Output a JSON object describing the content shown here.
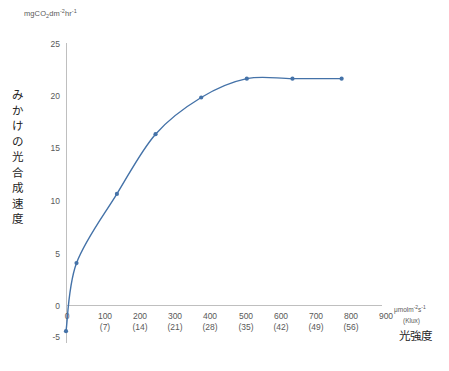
{
  "axes": {
    "y_unit_label": "mgCO2dm-2hr-1",
    "y_unit_parts": {
      "prefix": "mgCO",
      "sub": "2",
      "mid": "dm",
      "sup1": "-2",
      "mid2": "hr",
      "sup2": "-1"
    },
    "y_title_chars": [
      "み",
      "か",
      "け",
      "の",
      "光",
      "合",
      "成",
      "速",
      "度"
    ],
    "y_title": "みかけの光合成速度",
    "y_ticks": [
      "25",
      "20",
      "15",
      "10",
      "5",
      "0",
      "-5"
    ],
    "x_unit_label": "μmolm-2s-1",
    "x_unit_parts": {
      "prefix": "μmolm",
      "sup1": "-2",
      "mid": "s",
      "sup2": "-1"
    },
    "x_unit_secondary": "(Klux)",
    "x_title": "光強度",
    "x_ticks_primary": [
      "0",
      "100",
      "200",
      "300",
      "400",
      "500",
      "600",
      "700",
      "800",
      "900"
    ],
    "x_ticks_secondary": [
      "",
      "(7)",
      "(14)",
      "(21)",
      "(28)",
      "(35)",
      "(42)",
      "(49)",
      "(56)",
      ""
    ]
  },
  "chart_data": {
    "type": "scatter",
    "title": "",
    "xlabel": "光強度 μmolm⁻²s⁻¹ (Klux)",
    "ylabel": "みかけの光合成速度 mgCO₂dm⁻²hr⁻¹",
    "xlim": [
      0,
      900
    ],
    "ylim": [
      -5,
      25
    ],
    "grid": false,
    "legend": "none",
    "series": [
      {
        "name": "みかけの光合成速度",
        "color": "#4472a8",
        "marker": "circle",
        "x": [
          0,
          30,
          145,
          255,
          385,
          515,
          645,
          785
        ],
        "y": [
          -2.5,
          4.0,
          10.6,
          16.3,
          19.8,
          21.6,
          21.6,
          21.6
        ]
      }
    ],
    "curve_note": "smooth saturating photosynthesis light-response curve through the points",
    "x_secondary_axis": {
      "name": "Klux",
      "mapping": [
        [
          100,
          7
        ],
        [
          200,
          14
        ],
        [
          300,
          21
        ],
        [
          400,
          28
        ],
        [
          500,
          35
        ],
        [
          600,
          42
        ],
        [
          700,
          49
        ],
        [
          800,
          56
        ]
      ]
    }
  },
  "colors": {
    "series": "#4472a8",
    "axis": "#bfbfbf",
    "tick_text": "#595959",
    "title_text": "#262626",
    "background": "#ffffff"
  }
}
